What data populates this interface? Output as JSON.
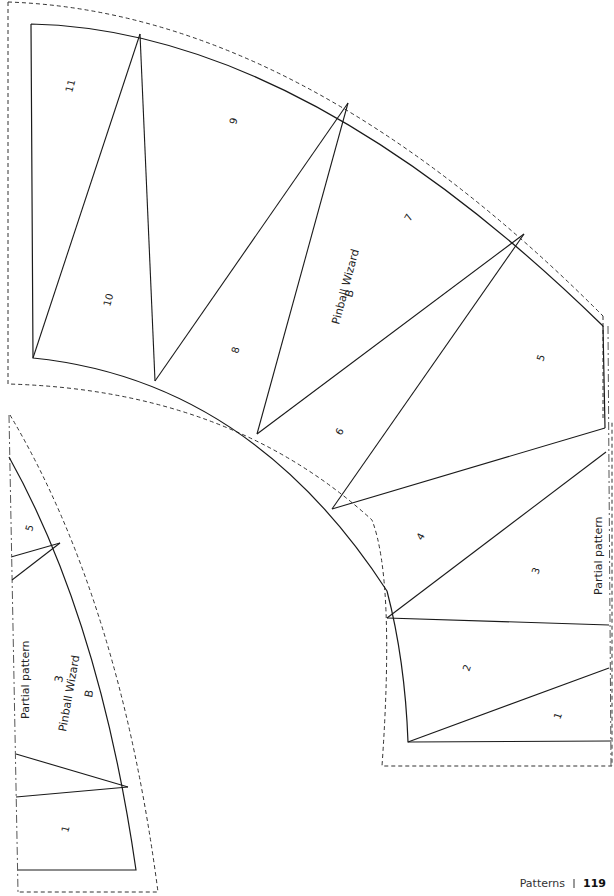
{
  "page": {
    "section_label": "Patterns",
    "page_number": "119"
  },
  "piece_b_large": {
    "title": "Pinball Wizard",
    "letter": "B",
    "note": "Partial pattern",
    "segments": [
      "1",
      "2",
      "3",
      "4",
      "5",
      "6",
      "7",
      "8",
      "9",
      "10",
      "11"
    ]
  },
  "piece_b_small": {
    "title": "Pinball Wizard",
    "letter": "B",
    "center_number": "3",
    "note": "Partial pattern",
    "segments": [
      "1",
      "5"
    ]
  },
  "colors": {
    "line": "#1a1a1a",
    "dash": "#333333",
    "background": "#ffffff"
  }
}
